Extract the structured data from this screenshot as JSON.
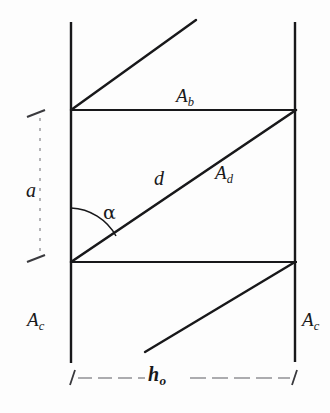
{
  "figure": {
    "caption_none": "",
    "background_color": "#fdfdfd",
    "ink_color": "#18181a",
    "labels": {
      "area_b": {
        "base": "A",
        "sub": "b"
      },
      "area_d": {
        "base": "A",
        "sub": "d"
      },
      "area_c_left": {
        "base": "A",
        "sub": "c"
      },
      "area_c_right": {
        "base": "A",
        "sub": "c"
      },
      "diagonal": "d",
      "height_dim": "a",
      "angle": "α",
      "width_dim": {
        "base": "h",
        "sub": "o"
      }
    }
  },
  "geometry": {
    "type": "line-diagram",
    "units": "px",
    "canvas": {
      "width": 330,
      "height": 413
    },
    "vertical_lines": [
      {
        "name": "left-wall",
        "x1": 71,
        "y1": 22,
        "x2": 71,
        "y2": 363
      },
      {
        "name": "right-wall",
        "x1": 295,
        "y1": 22,
        "x2": 295,
        "y2": 362
      }
    ],
    "horizontal_lines": [
      {
        "name": "upper-band",
        "x1": 71,
        "y1": 110,
        "x2": 296,
        "y2": 110
      },
      {
        "name": "lower-band",
        "x1": 71,
        "y1": 262,
        "x2": 296,
        "y2": 262
      }
    ],
    "diagonals": [
      {
        "name": "top-diagonal",
        "x1": 71,
        "y1": 110,
        "x2": 196,
        "y2": 20
      },
      {
        "name": "main-diagonal-d",
        "x1": 71,
        "y1": 262,
        "x2": 295,
        "y2": 110
      },
      {
        "name": "bottom-diagonal",
        "x1": 145,
        "y1": 352,
        "x2": 295,
        "y2": 262
      }
    ],
    "angle_arc": {
      "name": "alpha-arc",
      "vertex_x": 71,
      "vertex_y": 262,
      "radius": 54,
      "from_deg": 270,
      "to_deg": 326
    },
    "dimension_lines": [
      {
        "name": "height-dimension-a",
        "orientation": "vertical",
        "x": 40,
        "y_top": 112,
        "y_bottom": 260,
        "style": "dashed",
        "ticks": [
          "top",
          "bottom"
        ]
      },
      {
        "name": "width-dimension-ho",
        "orientation": "horizontal",
        "y": 378,
        "x_left": 71,
        "x_right": 296,
        "style": "dashed",
        "ticks": [
          "left",
          "right"
        ]
      }
    ]
  }
}
